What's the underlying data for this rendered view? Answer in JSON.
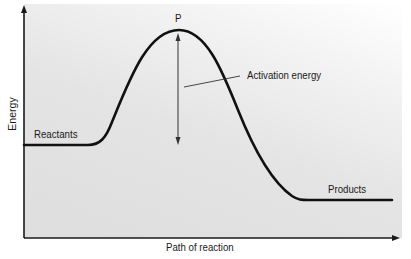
{
  "diagram": {
    "title": "",
    "type": "energy-profile",
    "axes": {
      "y_label": "Energy",
      "x_label": "Path of reaction"
    },
    "labels": {
      "peak": "P",
      "activation": "Activation energy",
      "reactants": "Reactants",
      "products": "Products"
    },
    "colors": {
      "curve": "#111111",
      "background": "#e0e0e0",
      "axis": "#1a1a1a"
    }
  }
}
